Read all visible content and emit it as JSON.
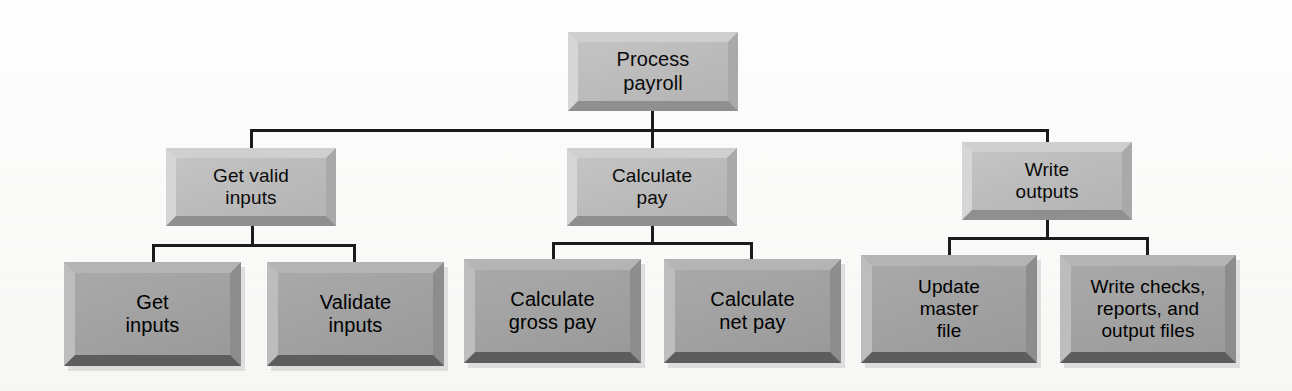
{
  "diagram": {
    "type": "structure-chart",
    "title_visible": false,
    "background_color": "#fbfbfa",
    "line_color": "#1b1b1b",
    "levels": 3,
    "level_fill_colors": {
      "level_1": "#bcbcbc",
      "level_2": "#bcbcbc",
      "level_3": "#a2a2a2"
    },
    "nodes": [
      {
        "id": "process-payroll",
        "label": "Process\npayroll",
        "level": 1,
        "style": "light",
        "x": 568,
        "y": 32,
        "w": 170,
        "h": 79,
        "font_size": 20
      },
      {
        "id": "get-valid-inputs",
        "label": "Get valid\ninputs",
        "level": 2,
        "style": "light",
        "x": 166,
        "y": 148,
        "w": 170,
        "h": 78,
        "font_size": 19
      },
      {
        "id": "calculate-pay",
        "label": "Calculate\npay",
        "level": 2,
        "style": "light",
        "x": 567,
        "y": 148,
        "w": 170,
        "h": 78,
        "font_size": 19
      },
      {
        "id": "write-outputs",
        "label": "Write\noutputs",
        "level": 2,
        "style": "light",
        "x": 962,
        "y": 142,
        "w": 170,
        "h": 78,
        "font_size": 19
      },
      {
        "id": "get-inputs",
        "label": "Get\ninputs",
        "level": 3,
        "style": "dark",
        "x": 64,
        "y": 262,
        "w": 177,
        "h": 104,
        "font_size": 20
      },
      {
        "id": "validate-inputs",
        "label": "Validate\ninputs",
        "level": 3,
        "style": "dark",
        "x": 267,
        "y": 262,
        "w": 177,
        "h": 104,
        "font_size": 20
      },
      {
        "id": "calculate-gross-pay",
        "label": "Calculate\ngross pay",
        "level": 3,
        "style": "dark",
        "x": 464,
        "y": 259,
        "w": 177,
        "h": 104,
        "font_size": 20
      },
      {
        "id": "calculate-net-pay",
        "label": "Calculate\nnet pay",
        "level": 3,
        "style": "dark",
        "x": 664,
        "y": 259,
        "w": 177,
        "h": 104,
        "font_size": 20
      },
      {
        "id": "update-master-file",
        "label": "Update\nmaster\nfile",
        "level": 3,
        "style": "dark",
        "x": 861,
        "y": 255,
        "w": 176,
        "h": 108,
        "font_size": 19
      },
      {
        "id": "write-checks-reports-output-files",
        "label": "Write checks,\nreports, and\noutput files",
        "level": 3,
        "style": "dark",
        "x": 1060,
        "y": 255,
        "w": 176,
        "h": 108,
        "font_size": 19
      }
    ],
    "connectors": [
      {
        "id": "root-stem",
        "kind": "v",
        "x": 651,
        "y": 110,
        "len": 21
      },
      {
        "id": "level1-bus",
        "kind": "h",
        "x": 250,
        "y": 129,
        "len": 798
      },
      {
        "id": "drop-get-valid",
        "kind": "v",
        "x": 250,
        "y": 129,
        "len": 20
      },
      {
        "id": "drop-calc-pay",
        "kind": "v",
        "x": 651,
        "y": 129,
        "len": 20
      },
      {
        "id": "drop-write-out",
        "kind": "v",
        "x": 1046,
        "y": 129,
        "len": 14
      },
      {
        "id": "stem-get-valid",
        "kind": "v",
        "x": 251,
        "y": 226,
        "len": 20
      },
      {
        "id": "bus-get-valid",
        "kind": "h",
        "x": 152,
        "y": 244,
        "len": 204
      },
      {
        "id": "drop-get-inputs",
        "kind": "v",
        "x": 152,
        "y": 244,
        "len": 19
      },
      {
        "id": "drop-validate",
        "kind": "v",
        "x": 353,
        "y": 244,
        "len": 19
      },
      {
        "id": "stem-calc-pay",
        "kind": "v",
        "x": 651,
        "y": 226,
        "len": 18
      },
      {
        "id": "bus-calc-pay",
        "kind": "h",
        "x": 552,
        "y": 242,
        "len": 201
      },
      {
        "id": "drop-calc-gross",
        "kind": "v",
        "x": 552,
        "y": 242,
        "len": 18
      },
      {
        "id": "drop-calc-net",
        "kind": "v",
        "x": 750,
        "y": 242,
        "len": 18
      },
      {
        "id": "stem-write-out",
        "kind": "v",
        "x": 1046,
        "y": 220,
        "len": 18
      },
      {
        "id": "bus-write-out",
        "kind": "h",
        "x": 948,
        "y": 237,
        "len": 201
      },
      {
        "id": "drop-update-master",
        "kind": "v",
        "x": 948,
        "y": 237,
        "len": 19
      },
      {
        "id": "drop-write-checks",
        "kind": "v",
        "x": 1146,
        "y": 237,
        "len": 19
      }
    ]
  }
}
